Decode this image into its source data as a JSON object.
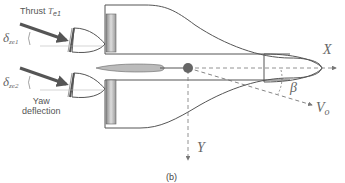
{
  "diagram": {
    "caption": "(b)",
    "labels": {
      "thrust": "Thrust",
      "thrust_symbol": "T",
      "thrust_sub": "e1",
      "delta1_symbol": "δ",
      "delta1_sub": "ze1",
      "delta2_symbol": "δ",
      "delta2_sub": "ze2",
      "yaw_line1": "Yaw",
      "yaw_line2": "deflection",
      "x_axis": "X",
      "y_axis": "Y",
      "beta": "β",
      "velocity_symbol": "V",
      "velocity_sub": "o"
    },
    "colors": {
      "outline": "#555555",
      "arrow": "#555555",
      "dashed": "#666666",
      "fin_fill": "#bbbbbb",
      "cg_dot": "#666666"
    }
  }
}
